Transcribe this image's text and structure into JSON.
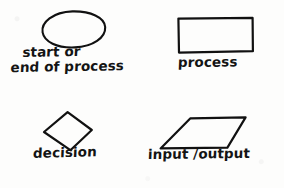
{
  "diagram": {
    "style": "hand-drawn sketch on white paper",
    "ink_color": "#111111",
    "background_color": "#fdfdfc",
    "symbols": [
      {
        "id": "terminator",
        "shape": "oval",
        "label_lines": [
          "start or",
          "end of process"
        ],
        "label_text": "start or end of process"
      },
      {
        "id": "process",
        "shape": "rectangle",
        "label_lines": [
          "process"
        ],
        "label_text": "process"
      },
      {
        "id": "decision",
        "shape": "diamond",
        "label_lines": [
          "decision"
        ],
        "label_text": "decision"
      },
      {
        "id": "input-output",
        "shape": "parallelogram",
        "label_lines": [
          "input /output"
        ],
        "label_text": "input /output"
      }
    ]
  }
}
